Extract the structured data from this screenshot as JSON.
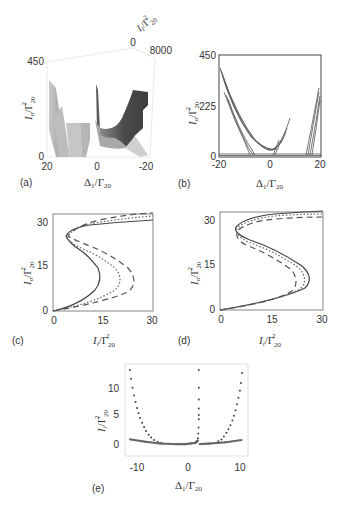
{
  "figure": {
    "panels": [
      {
        "id": "a",
        "label": "(a)"
      },
      {
        "id": "b",
        "label": "(b)"
      },
      {
        "id": "c",
        "label": "(c)"
      },
      {
        "id": "d",
        "label": "(d)"
      },
      {
        "id": "e",
        "label": "(e)"
      }
    ]
  },
  "chart_data": [
    {
      "panel": "(a)",
      "type": "surface3d",
      "title": "",
      "xlabel": "Δ1/Γ20",
      "ylabel": "Io/Γ20^2",
      "zlabel": "Ii/Γ20^2",
      "x_ticks": [
        "20",
        "0",
        "-20"
      ],
      "y_ticks": [
        "0",
        "450"
      ],
      "z_ticks": [
        "0",
        "8000"
      ],
      "xlim": [
        20,
        -20
      ],
      "ylim": [
        0,
        450
      ],
      "zlim": [
        0,
        8000
      ]
    },
    {
      "panel": "(b)",
      "type": "line",
      "xlabel": "Δ1/Γ20",
      "ylabel": "Io/Γ20^2",
      "x_ticks": [
        "-20",
        "0",
        "20"
      ],
      "y_ticks": [
        "0",
        "225",
        "450"
      ],
      "xlim": [
        -20,
        20
      ],
      "ylim": [
        0,
        450
      ],
      "series": [
        {
          "name": "left-branch",
          "x": [
            -20,
            -15,
            -10,
            -5,
            0,
            3,
            6.5
          ],
          "y": [
            400,
            270,
            160,
            70,
            20,
            60,
            185
          ]
        },
        {
          "name": "left-fold",
          "x": [
            -17,
            -14,
            -11,
            -9
          ],
          "y": [
            230,
            130,
            40,
            0
          ]
        },
        {
          "name": "right-branch",
          "x": [
            14,
            16,
            18,
            20
          ],
          "y": [
            0,
            90,
            200,
            290
          ]
        }
      ]
    },
    {
      "panel": "(c)",
      "type": "line",
      "xlabel": "Ii/Γ20^2",
      "ylabel": "Io/Γ20^2",
      "x_ticks": [
        "0",
        "15",
        "30"
      ],
      "y_ticks": [
        "0",
        "15",
        "30"
      ],
      "xlim": [
        0,
        30
      ],
      "ylim": [
        0,
        32
      ],
      "series": [
        {
          "name": "solid",
          "style": "solid",
          "x": [
            0,
            8,
            15,
            13,
            5,
            3,
            4,
            15,
            30
          ],
          "y": [
            0,
            2,
            8,
            12,
            17,
            21,
            23,
            27,
            29.5
          ]
        },
        {
          "name": "dotted",
          "style": "dotted",
          "x": [
            0,
            10,
            22,
            20,
            8,
            3.5,
            5,
            17,
            30
          ],
          "y": [
            0,
            2,
            8,
            13,
            18,
            22,
            25,
            29,
            31
          ]
        },
        {
          "name": "dashed",
          "style": "dashed",
          "x": [
            0,
            12,
            26,
            22,
            10,
            4,
            6,
            19,
            30
          ],
          "y": [
            0,
            2,
            8,
            14,
            19,
            23,
            26,
            30.5,
            32.5
          ]
        }
      ]
    },
    {
      "panel": "(d)",
      "type": "line",
      "xlabel": "Ii/Γ20^2",
      "ylabel": "Io/Γ20^2",
      "x_ticks": [
        "0",
        "15",
        "30"
      ],
      "y_ticks": [
        "0",
        "15",
        "30"
      ],
      "xlim": [
        0,
        30
      ],
      "ylim": [
        0,
        33
      ],
      "series": [
        {
          "name": "solid",
          "style": "solid",
          "x": [
            0,
            15,
            26,
            24,
            14,
            5,
            4.5,
            8,
            30
          ],
          "y": [
            0,
            3,
            8,
            12,
            17,
            22,
            24,
            28,
            32.5
          ]
        },
        {
          "name": "dotted",
          "style": "dotted",
          "x": [
            0,
            15,
            24.5,
            22,
            13,
            5,
            5,
            9,
            30
          ],
          "y": [
            0,
            3,
            8,
            12,
            17,
            21.5,
            24,
            28,
            31.5
          ]
        },
        {
          "name": "dashed",
          "style": "dashed",
          "x": [
            0,
            15,
            21,
            19,
            12,
            5,
            5.5,
            10,
            30
          ],
          "y": [
            0,
            3,
            7,
            11,
            16,
            21,
            23.5,
            27.5,
            30.5
          ]
        }
      ]
    },
    {
      "panel": "(e)",
      "type": "scatter",
      "xlabel": "Δ1/Γ20",
      "ylabel": "Ii/Γ20^2",
      "x_ticks": [
        "-10",
        "0",
        "10"
      ],
      "y_ticks": [
        "0",
        "5",
        "10"
      ],
      "xlim": [
        -12,
        12.5
      ],
      "ylim": [
        -2,
        13.5
      ],
      "series": [
        {
          "name": "upper-left",
          "x": [
            -11,
            -10.8,
            -10.5,
            -10.2,
            -9.9,
            -9.6,
            -9.3,
            -9,
            -8.6,
            -8.2,
            -7.8,
            -7.3,
            -6.8,
            -6.2,
            -5.5,
            -4.8
          ],
          "y": [
            12.5,
            11,
            9.5,
            8.2,
            7.1,
            6.1,
            5.2,
            4.4,
            3.6,
            2.9,
            2.2,
            1.6,
            1.1,
            0.7,
            0.4,
            0.2
          ]
        },
        {
          "name": "center",
          "x": [
            2.7,
            2.7,
            2.7,
            2.7,
            2.7,
            2.7,
            2.65,
            2.6,
            2.5
          ],
          "y": [
            12.5,
            9.5,
            7.5,
            6,
            4.9,
            4.2,
            2.8,
            1.8,
            1
          ]
        },
        {
          "name": "upper-right",
          "x": [
            11.3,
            11.1,
            10.9,
            10.6,
            10.3,
            10,
            9.7,
            9.4,
            9,
            8.6,
            8.2,
            7.7,
            7.2,
            6.6,
            6
          ],
          "y": [
            12,
            10.3,
            9,
            7.8,
            6.7,
            5.7,
            4.8,
            4,
            3.2,
            2.5,
            1.9,
            1.3,
            0.8,
            0.5,
            0.2
          ]
        },
        {
          "name": "lower-band-left",
          "x": [
            -11,
            -8,
            -5,
            -2,
            0,
            2,
            2.5
          ],
          "y": [
            0.8,
            0.4,
            0.1,
            0,
            0,
            0.2,
            0.6
          ]
        },
        {
          "name": "lower-band-right",
          "x": [
            2.9,
            5,
            8,
            11.3
          ],
          "y": [
            0,
            0.1,
            0.3,
            0.7
          ]
        }
      ]
    }
  ],
  "panel_a": {
    "y_tick_top": "450",
    "y_tick_bottom": "0",
    "z_tick_0": "0",
    "z_tick_max": "8000",
    "x_tick_left": "20",
    "x_tick_mid": "0",
    "x_tick_right": "-20"
  },
  "panel_b": {
    "y_tick_top": "450",
    "y_tick_mid": "225",
    "y_tick_bottom": "0",
    "x_tick_left": "-20",
    "x_tick_mid": "0",
    "x_tick_right": "20"
  },
  "panel_c": {
    "y_tick_top": "30",
    "y_tick_mid": "15",
    "y_tick_bottom": "0",
    "x_tick_left": "0",
    "x_tick_mid": "15",
    "x_tick_right": "30"
  },
  "panel_d": {
    "y_tick_top": "30",
    "y_tick_mid": "15",
    "y_tick_bottom": "0",
    "x_tick_left": "0",
    "x_tick_mid": "15",
    "x_tick_right": "30"
  },
  "panel_e": {
    "y_tick_top": "10",
    "y_tick_mid": "5",
    "y_tick_bottom": "0",
    "x_tick_left": "-10",
    "x_tick_mid": "0",
    "x_tick_right": "10"
  },
  "labels": {
    "delta": "Δ",
    "delta_sub": "1",
    "gamma": "/Γ",
    "gamma_sub": "20",
    "sq": "2",
    "I": "I",
    "o_sub": "o",
    "i_sub": "i"
  }
}
